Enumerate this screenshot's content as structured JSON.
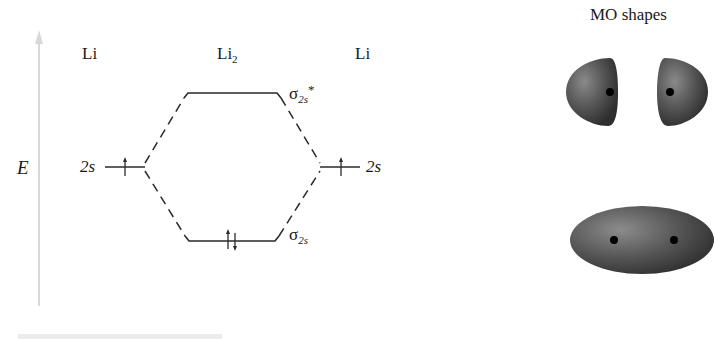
{
  "diagram": {
    "type": "molecular-orbital-energy-diagram",
    "axis": {
      "label": "E",
      "direction": "up",
      "color": "#d8d8d8"
    },
    "columns": {
      "left_atom": "Li",
      "molecule": {
        "base": "Li",
        "subscript": "2"
      },
      "right_atom": "Li"
    },
    "atomic_orbitals": {
      "left": {
        "label": "2s",
        "electrons": "↑"
      },
      "right": {
        "label": "2s",
        "electrons": "↑"
      }
    },
    "molecular_orbitals": {
      "antibonding": {
        "symbol": "σ",
        "subscript": "2s",
        "superscript": "*",
        "electrons": ""
      },
      "bonding": {
        "symbol": "σ",
        "subscript": "2s",
        "electrons": "↑↓"
      }
    },
    "line_color": "#2a2a2a"
  },
  "mo_shapes": {
    "title": "MO shapes",
    "antibonding_shape": "two separated lobes with nuclei dots",
    "bonding_shape": "single ellipsoid enclosing two nuclei dots",
    "lobe_color": "#4a4a4a"
  }
}
